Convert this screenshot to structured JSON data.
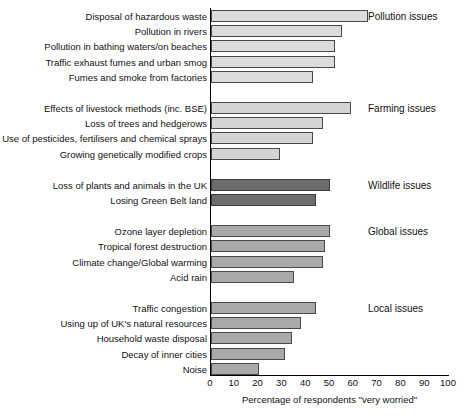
{
  "chart_data": {
    "type": "bar",
    "orientation": "horizontal",
    "title": "",
    "xlabel": "Percentage of respondents \"very worried\"",
    "ylabel": "",
    "xlim": [
      0,
      100
    ],
    "xticks": [
      0,
      10,
      20,
      30,
      40,
      50,
      60,
      70,
      80,
      90,
      100
    ],
    "grid": false,
    "legend": "none",
    "groups": [
      {
        "name": "Pollution issues",
        "color": "#dcdcdc",
        "categories": [
          "Disposal of hazardous waste",
          "Pollution in rivers",
          "Pollution in bathing waters/on beaches",
          "Traffic exhaust fumes and urban smog",
          "Fumes and smoke from factories"
        ],
        "values": [
          66,
          55,
          52,
          52,
          43
        ]
      },
      {
        "name": "Farming issues",
        "color": "#d4d4d4",
        "categories": [
          "Effects of livestock methods (inc. BSE)",
          "Loss of trees and hedgerows",
          "Use of pesticides, fertilisers and chemical sprays",
          "Growing genetically modified crops"
        ],
        "values": [
          59,
          47,
          43,
          29
        ]
      },
      {
        "name": "Wildlife issues",
        "color": "#6d6d6d",
        "categories": [
          "Loss of plants and animals in the UK",
          "Losing Green Belt land"
        ],
        "values": [
          50,
          44
        ]
      },
      {
        "name": "Global issues",
        "color": "#a9a9a9",
        "categories": [
          "Ozone layer depletion",
          "Tropical forest destruction",
          "Climate change/Global warming",
          "Acid rain"
        ],
        "values": [
          50,
          48,
          47,
          35
        ]
      },
      {
        "name": "Local issues",
        "color": "#a9a9a9",
        "categories": [
          "Traffic congestion",
          "Using up of UK's natural resources",
          "Household waste disposal",
          "Decay of inner cities",
          "Noise"
        ],
        "values": [
          44,
          38,
          34,
          31,
          20
        ]
      }
    ]
  }
}
